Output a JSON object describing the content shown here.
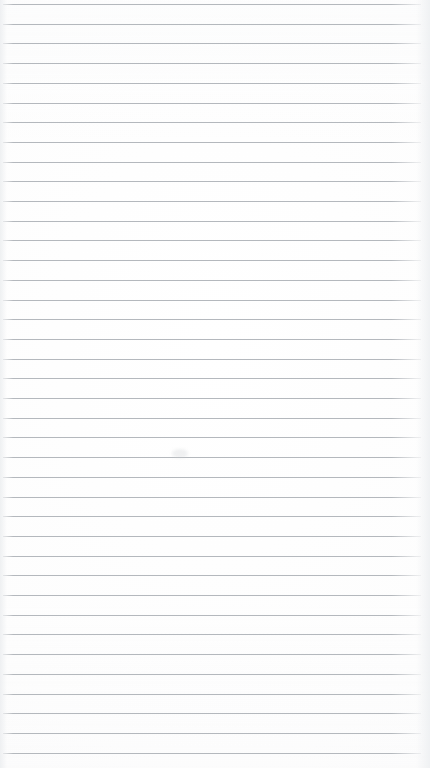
{
  "document": {
    "type": "ruled-notebook-page",
    "title": "Blank lined paper",
    "content_text": "",
    "is_blank": true,
    "orientation": "portrait",
    "page_width_px": 430,
    "page_height_px": 768
  },
  "paper": {
    "background_color": "#ffffff",
    "edge_shadow_color": "#eceef0",
    "margin_note": "no vertical margin rule drawn"
  },
  "ruling": {
    "line_color": "#b4b8bd",
    "line_thickness_px": 1,
    "line_spacing_px": 19.7,
    "first_line_y_px": 4,
    "line_count": 39,
    "line_start_x_px": 3,
    "line_end_x_px": 421,
    "fade_at_edges": true
  },
  "artifacts": {
    "smudge_label": "faint scan smudge",
    "smudge_x_px": 172,
    "smudge_y_px": 449
  },
  "annotations": {
    "handwriting": [],
    "text_lines": []
  }
}
